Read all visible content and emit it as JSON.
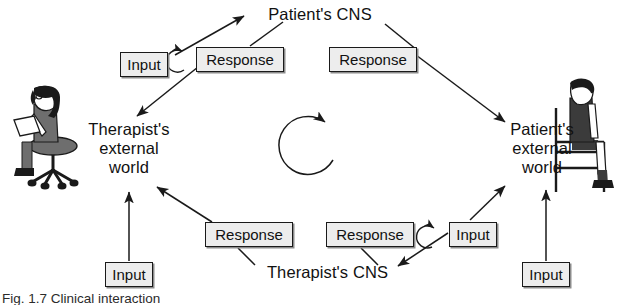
{
  "figure": {
    "caption": "Fig. 1.7  Clinical interaction",
    "background_color": "#ffffff",
    "ink_color": "#1a1a1a",
    "box_fill_color": "#ededed"
  },
  "nodes": {
    "patient_cns": "Patient's CNS",
    "therapist_cns": "Therapist's CNS",
    "therapist_external_world": "Therapist's\nexternal\nworld",
    "patient_external_world": "Patient's\nexternal\nworld"
  },
  "boxes": [
    {
      "id": "input-top-left",
      "label": "Input",
      "x": 120,
      "y": 52,
      "w": 48,
      "h": 25
    },
    {
      "id": "response-top-left",
      "label": "Response",
      "x": 196,
      "y": 47,
      "w": 88,
      "h": 25
    },
    {
      "id": "response-top-right",
      "label": "Response",
      "x": 329,
      "y": 47,
      "w": 88,
      "h": 25
    },
    {
      "id": "response-bottom-left",
      "label": "Response",
      "x": 205,
      "y": 222,
      "w": 88,
      "h": 25
    },
    {
      "id": "response-bottom-right",
      "label": "Response",
      "x": 326,
      "y": 222,
      "w": 88,
      "h": 25
    },
    {
      "id": "input-bottom-right-curl",
      "label": "Input",
      "x": 449,
      "y": 222,
      "w": 48,
      "h": 25
    },
    {
      "id": "input-bottom-left",
      "label": "Input",
      "x": 105,
      "y": 262,
      "w": 48,
      "h": 25
    },
    {
      "id": "input-far-right",
      "label": "Input",
      "x": 522,
      "y": 262,
      "w": 48,
      "h": 25
    }
  ],
  "figures": {
    "therapist": {
      "role": "therapist-seated-with-notepad-on-stool",
      "x": 10,
      "y": 88
    },
    "patient": {
      "role": "patient-seated-on-chair",
      "x": 548,
      "y": 82
    }
  },
  "flow": {
    "center_arrow": "clockwise-cycle-arrow",
    "edges": [
      "input-top-left -> patient-cns",
      "patient-cns -> response-top-left",
      "response-top-left -> therapist-external-world",
      "patient-cns -> response-top-right",
      "response-top-right -> patient-external-world",
      "input-bottom-right-curl -> therapist-cns",
      "therapist-cns -> response-bottom-right",
      "therapist-cns -> response-bottom-left",
      "response-bottom-left -> therapist-external-world",
      "input-bottom-right-curl -> patient-external-world",
      "input-bottom-left -> therapist-external-world",
      "input-far-right -> patient-external-world"
    ]
  }
}
